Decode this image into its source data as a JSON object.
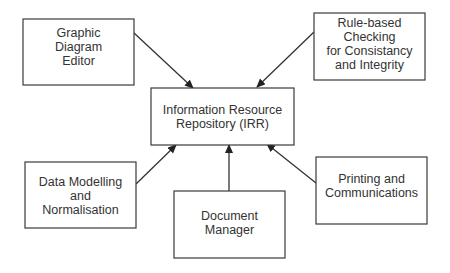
{
  "diagram": {
    "type": "block-diagram",
    "nodes": [
      {
        "id": "gde",
        "lines": [
          "Graphic",
          "Diagram",
          "Editor"
        ]
      },
      {
        "id": "rule",
        "lines": [
          "Rule-based",
          "Checking",
          "for Consistancy",
          "and Integrity"
        ]
      },
      {
        "id": "irr",
        "lines": [
          "Information Resource",
          "Repository (IRR)"
        ]
      },
      {
        "id": "dm",
        "lines": [
          "Data Modelling",
          "and",
          "Normalisation"
        ]
      },
      {
        "id": "doc",
        "lines": [
          "Document",
          "Manager"
        ]
      },
      {
        "id": "print",
        "lines": [
          "Printing and",
          "Communications"
        ]
      }
    ],
    "edges": [
      {
        "from": "gde",
        "to": "irr"
      },
      {
        "from": "rule",
        "to": "irr"
      },
      {
        "from": "dm",
        "to": "irr"
      },
      {
        "from": "doc",
        "to": "irr"
      },
      {
        "from": "print",
        "to": "irr"
      }
    ],
    "colors": {
      "stroke": "#3a3a3a",
      "text": "#333333",
      "background": "#ffffff"
    }
  }
}
